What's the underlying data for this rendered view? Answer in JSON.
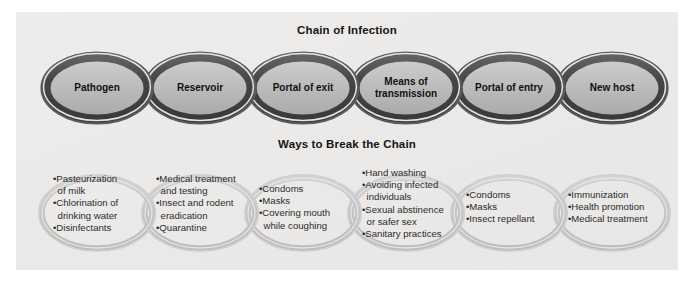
{
  "figure": {
    "title_top": "Chain of Infection",
    "title_bottom": "Ways to Break the Chain",
    "background_color": "#ffffff",
    "panel_color": "#ecebe9",
    "top_chain_ring_color": "#4e4e4e",
    "top_chain_fill_color": "#b8b8b8",
    "bottom_chain_ring_color": "#c6c6c6",
    "text_color": "#111111"
  },
  "chain_of_infection": {
    "links": [
      {
        "label": "Pathogen"
      },
      {
        "label": "Reservoir"
      },
      {
        "label": "Portal of exit"
      },
      {
        "label": "Means of\ntransmission"
      },
      {
        "label": "Portal of entry"
      },
      {
        "label": "New host"
      }
    ]
  },
  "ways_to_break_the_chain": {
    "links": [
      {
        "for_link": "Pathogen",
        "items": [
          "Pasteurization\nof milk",
          "Chlorination of\ndrinking water",
          "Disinfectants"
        ]
      },
      {
        "for_link": "Reservoir",
        "items": [
          "Medical treatment\nand testing",
          "Insect and rodent\neradication",
          "Quarantine"
        ]
      },
      {
        "for_link": "Portal of exit",
        "items": [
          "Condoms",
          "Masks",
          "Covering mouth\nwhile coughing"
        ]
      },
      {
        "for_link": "Means of transmission",
        "items": [
          "Hand washing",
          "Avoiding infected\nindividuals",
          "Sexual abstinence\nor safer sex",
          "Sanitary practices"
        ]
      },
      {
        "for_link": "Portal of entry",
        "items": [
          "Condoms",
          "Masks",
          "Insect repellant"
        ]
      },
      {
        "for_link": "New host",
        "items": [
          "Immunization",
          "Health promotion",
          "Medical treatment"
        ]
      }
    ]
  }
}
